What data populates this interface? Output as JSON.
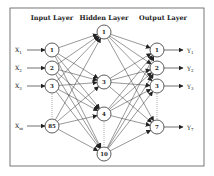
{
  "diagram": {
    "type": "neural-network",
    "colors": {
      "stroke": "#333333",
      "background": "#ffffff",
      "frame": "#555555"
    },
    "frame": {
      "x": 10,
      "y": 8,
      "w": 194,
      "h": 158
    },
    "layers": [
      {
        "id": "input",
        "title": "Input Layer",
        "title_x": 52,
        "nodes": [
          {
            "label": "1",
            "x": 52,
            "y": 50
          },
          {
            "label": "2",
            "x": 52,
            "y": 68
          },
          {
            "label": "3",
            "x": 52,
            "y": 86
          },
          {
            "label": "85",
            "x": 52,
            "y": 126
          }
        ],
        "ellipsis": {
          "x": 52,
          "y1": 94,
          "y2": 118
        }
      },
      {
        "id": "hidden",
        "title": "Hidden Layer",
        "title_x": 104,
        "nodes": [
          {
            "label": "1",
            "x": 104,
            "y": 32
          },
          {
            "label": "3",
            "x": 104,
            "y": 82
          },
          {
            "label": "4",
            "x": 104,
            "y": 114
          },
          {
            "label": "10",
            "x": 104,
            "y": 154
          }
        ],
        "ellipsis": {
          "x": 104,
          "y1": 122,
          "y2": 146
        }
      },
      {
        "id": "output",
        "title": "Output Layer",
        "title_x": 163,
        "nodes": [
          {
            "label": "1",
            "x": 157,
            "y": 50
          },
          {
            "label": "2",
            "x": 157,
            "y": 68
          },
          {
            "label": "3",
            "x": 157,
            "y": 86
          },
          {
            "label": "7",
            "x": 157,
            "y": 127
          }
        ],
        "ellipsis": {
          "x": 157,
          "y1": 94,
          "y2": 119
        }
      }
    ],
    "inputs": [
      {
        "base": "X",
        "sub": "1",
        "y": 50
      },
      {
        "base": "X",
        "sub": "2",
        "y": 68
      },
      {
        "base": "X",
        "sub": "3",
        "y": 86
      },
      {
        "base": "X",
        "sub": "m",
        "y": 126
      }
    ],
    "outputs": [
      {
        "base": "Y",
        "sub": "1",
        "y": 50
      },
      {
        "base": "Y",
        "sub": "2",
        "y": 68
      },
      {
        "base": "Y",
        "sub": "3",
        "y": 86
      },
      {
        "base": "Y",
        "sub": "7",
        "y": 127
      }
    ],
    "node_radius": 7
  }
}
